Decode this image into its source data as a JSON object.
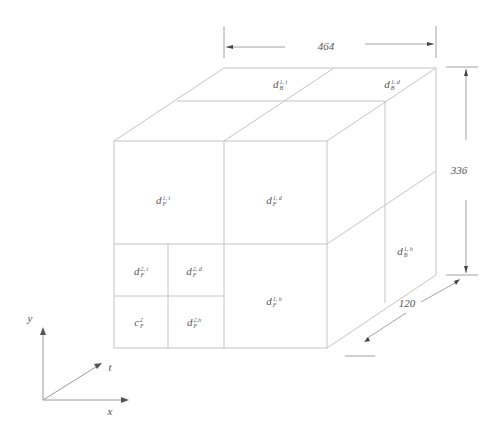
{
  "diagram": {
    "type": "3d-block-decomposition",
    "dimensions": {
      "width": "464",
      "height": "336",
      "depth": "120"
    },
    "axes": {
      "x": "x",
      "y": "y",
      "t": "t"
    },
    "blocks": {
      "top": [
        {
          "base": "d",
          "sub": "B",
          "sup": "1, t"
        },
        {
          "base": "d",
          "sub": "B",
          "sup": "1, d"
        }
      ],
      "front": [
        {
          "base": "d",
          "sub": "F",
          "sup": "1, t"
        },
        {
          "base": "d",
          "sub": "F",
          "sup": "1, d"
        },
        {
          "base": "d",
          "sub": "F",
          "sup": "2, t"
        },
        {
          "base": "d",
          "sub": "F",
          "sup": "2, d"
        },
        {
          "base": "c",
          "sub": "F",
          "sup": "2"
        },
        {
          "base": "d",
          "sub": "F",
          "sup": "2,h"
        },
        {
          "base": "d",
          "sub": "F",
          "sup": "1, h"
        }
      ],
      "side": [
        {
          "base": "d",
          "sub": "B",
          "sup": "1, h"
        }
      ]
    },
    "colors": {
      "line": "#c4c4c4",
      "dimension": "#8a8a8a",
      "text": "#555555"
    }
  }
}
